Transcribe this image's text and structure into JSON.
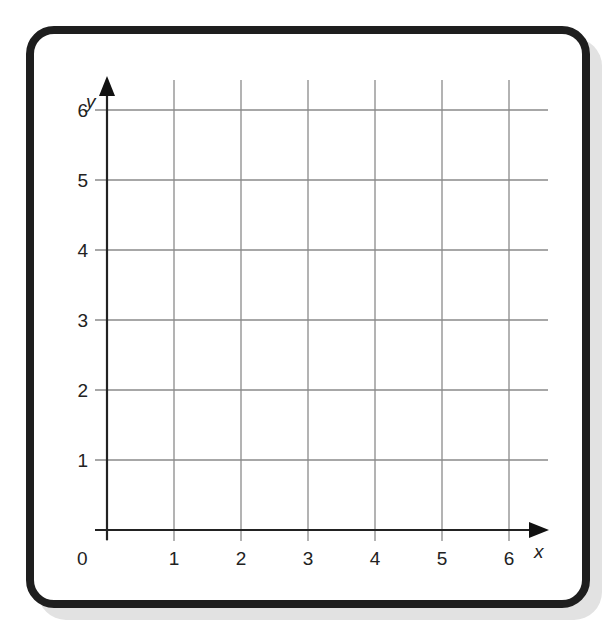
{
  "chart_data": {
    "type": "grid",
    "title": "",
    "xlabel": "x",
    "ylabel": "y",
    "xlim": [
      0,
      6
    ],
    "ylim": [
      0,
      6
    ],
    "x_ticks": [
      "1",
      "2",
      "3",
      "4",
      "5",
      "6"
    ],
    "y_ticks": [
      "1",
      "2",
      "3",
      "4",
      "5",
      "6"
    ],
    "origin_label": "0",
    "grid": true,
    "series": []
  },
  "colors": {
    "border": "#1e1e1e",
    "grid": "#8a8a8a",
    "axis": "#222222",
    "shadow": "#e2e2e2"
  }
}
